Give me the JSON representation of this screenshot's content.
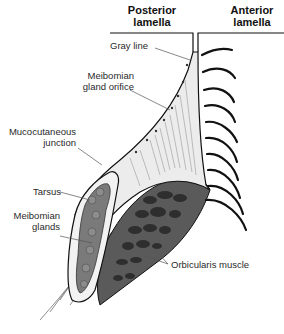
{
  "diagram": {
    "headers": {
      "posterior": [
        "Posterior",
        "lamella"
      ],
      "anterior": [
        "Anterior",
        "lamella"
      ]
    },
    "labels": {
      "gray_line": "Gray line",
      "meibomian_orifice": [
        "Meibomian",
        "gland orifice"
      ],
      "mucocutaneous": [
        "Mucocutaneous",
        "junction"
      ],
      "tarsus": "Tarsus",
      "meibomian_glands": [
        "Meibomian",
        "glands"
      ],
      "orbicularis": "Orbicularis muscle"
    },
    "colors": {
      "ink": "#111111",
      "label_text": "#2a2a2a",
      "leader_line": "#555555",
      "tissue_light": "#e6e6e6",
      "tarsus_fill": "#d9d9d9",
      "gland_fill": "#7a7a7a",
      "muscle_fill": "#5a5a5a",
      "muscle_bundle": "#2e2e2e"
    }
  }
}
